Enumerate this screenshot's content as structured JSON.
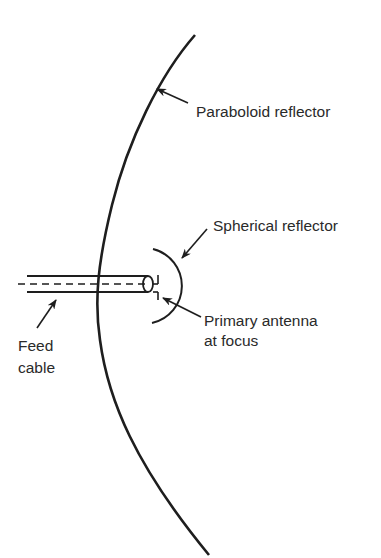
{
  "diagram": {
    "colors": {
      "line": "#1e1e1e",
      "text": "#2a2a2a",
      "background": "#ffffff"
    },
    "labels": {
      "paraboloid": "Paraboloid reflector",
      "spherical": "Spherical reflector",
      "primary_line1": "Primary antenna",
      "primary_line2": "at focus",
      "feed_line1": "Feed",
      "feed_line2": "cable"
    },
    "components": [
      {
        "id": "paraboloid-reflector",
        "label": "Paraboloid reflector"
      },
      {
        "id": "spherical-reflector",
        "label": "Spherical reflector"
      },
      {
        "id": "primary-antenna",
        "label": "Primary antenna at focus"
      },
      {
        "id": "feed-cable",
        "label": "Feed cable"
      }
    ]
  }
}
